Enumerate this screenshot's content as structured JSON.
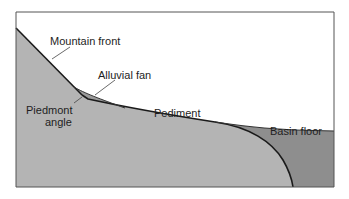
{
  "diagram": {
    "colors": {
      "background": "#ffffff",
      "bedrock": "#b4b4b4",
      "fan": "#9e9e9e",
      "basin_fill": "#8e8e8e",
      "outline": "#1a1a1a",
      "frame": "#555555"
    },
    "labels": {
      "mountain_front": "Mountain front",
      "alluvial_fan": "Alluvial fan",
      "piedmont_angle_line1": "Piedmont",
      "piedmont_angle_line2": "angle",
      "pediment": "Pediment",
      "basin_floor": "Basin floor"
    }
  }
}
